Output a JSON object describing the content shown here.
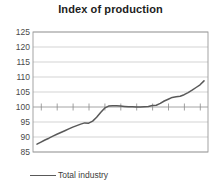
{
  "chart_data": {
    "type": "line",
    "title": "Index of production",
    "xlabel": "",
    "ylabel": "",
    "ylim": [
      85,
      125
    ],
    "xlim": [
      1995.75,
      2006.75
    ],
    "ytick_step": 5,
    "yticks": [
      85,
      90,
      95,
      100,
      105,
      110,
      115,
      120,
      125
    ],
    "xticks": [
      1996,
      1998,
      2000,
      2002,
      2004,
      2006
    ],
    "xtick_labels": [
      "1996",
      "1998",
      "2000",
      "2002",
      "2004",
      "2006"
    ],
    "ytick_labels": [
      "85",
      "90",
      "95",
      "100",
      "105",
      "110",
      "115",
      "120",
      "125"
    ],
    "grid": true,
    "grid_axis": "y",
    "legend_position": "bottom-left",
    "baseline_value": 100,
    "series": [
      {
        "name": "Total industry",
        "color": "#595959",
        "style": "solid",
        "x": [
          1996.0,
          1996.25,
          1996.5,
          1996.75,
          1997.0,
          1997.25,
          1997.5,
          1997.75,
          1998.0,
          1998.25,
          1998.5,
          1998.75,
          1999.0,
          1999.25,
          1999.5,
          1999.75,
          2000.0,
          2000.25,
          2000.5,
          2000.75,
          2001.0,
          2001.25,
          2001.5,
          2001.75,
          2002.0,
          2002.25,
          2002.5,
          2002.75,
          2003.0,
          2003.25,
          2003.5,
          2003.75,
          2004.0,
          2004.25,
          2004.5,
          2004.75,
          2005.0,
          2005.25,
          2005.5,
          2005.75,
          2006.0,
          2006.25,
          2006.5
        ],
        "values": [
          87.6,
          88.3,
          89.0,
          89.6,
          90.3,
          90.9,
          91.5,
          92.1,
          92.7,
          93.3,
          93.8,
          94.3,
          94.7,
          94.6,
          95.3,
          96.6,
          98.2,
          99.6,
          100.3,
          100.4,
          100.4,
          100.3,
          100.2,
          100.1,
          100.1,
          100.0,
          100.0,
          100.1,
          100.2,
          100.5,
          100.6,
          101.2,
          102.0,
          102.6,
          103.2,
          103.4,
          103.6,
          104.1,
          104.8,
          105.6,
          106.5,
          107.4,
          108.7
        ]
      }
    ],
    "legend": [
      {
        "label": "Total industry",
        "color": "#595959"
      }
    ]
  },
  "legend": {
    "total_industry_label": "Total industry"
  }
}
